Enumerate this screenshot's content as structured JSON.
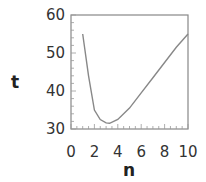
{
  "chart_data": {
    "type": "line",
    "title": "",
    "xlabel": "n",
    "ylabel": "t",
    "xlim": [
      0,
      10
    ],
    "ylim": [
      30,
      60
    ],
    "xticks": [
      "0",
      "2",
      "4",
      "6",
      "8",
      "10"
    ],
    "yticks": [
      "30",
      "40",
      "50",
      "60"
    ],
    "grid": false,
    "series": [
      {
        "name": "t(n)",
        "x": [
          1,
          1.5,
          2,
          2.5,
          3,
          3.3,
          4,
          5,
          6,
          7,
          8,
          9,
          10
        ],
        "y": [
          55,
          44,
          35,
          32.5,
          31.6,
          31.5,
          32.5,
          35.5,
          39.5,
          43.5,
          47.5,
          51.5,
          55
        ]
      }
    ]
  }
}
